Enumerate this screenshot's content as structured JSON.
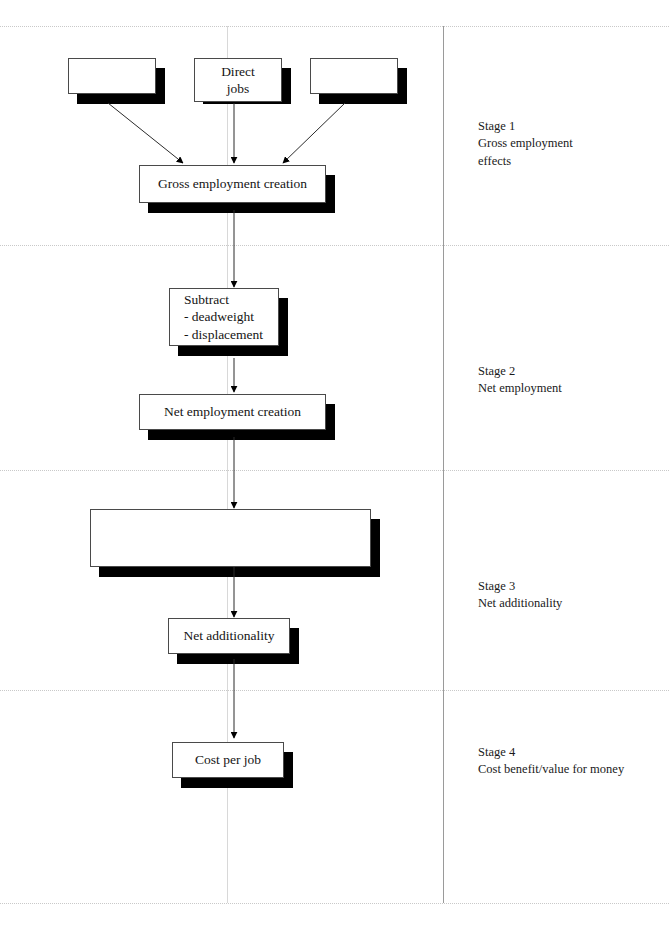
{
  "diagram": {
    "boxes": [
      {
        "id": "top-left",
        "label": ""
      },
      {
        "id": "direct-jobs",
        "label": "Direct\njobs"
      },
      {
        "id": "top-right",
        "label": ""
      },
      {
        "id": "gross-employment",
        "label": "Gross employment creation"
      },
      {
        "id": "subtract",
        "label": "Subtract\n- deadweight\n- displacement"
      },
      {
        "id": "net-employment",
        "label": "Net employment creation"
      },
      {
        "id": "stage3-large",
        "label": ""
      },
      {
        "id": "net-additionality",
        "label": "Net additionality"
      },
      {
        "id": "cost-per-job",
        "label": "Cost per job"
      }
    ],
    "stages": [
      {
        "id": "stage-1",
        "label": "Stage 1\nGross employment\neffects"
      },
      {
        "id": "stage-2",
        "label": "Stage 2\nNet employment"
      },
      {
        "id": "stage-3",
        "label": "Stage 3\nNet additionality"
      },
      {
        "id": "stage-4",
        "label": "Stage 4\nCost benefit/value for money"
      }
    ],
    "colors": {
      "box_border": "#4a4a4a",
      "box_fill": "#ffffff",
      "shadow": "#000000",
      "divider": "#c9c9c9",
      "rule": "#9a9a9a",
      "text": "#141414"
    }
  }
}
